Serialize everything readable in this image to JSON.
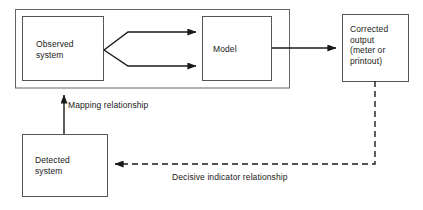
{
  "diagram": {
    "stroke_color": "#1a1a1a",
    "background_color": "#ffffff",
    "nodes": [
      {
        "id": "outer-container",
        "label": "",
        "shape": "rectangle",
        "style": "solid"
      },
      {
        "id": "observed-system",
        "label": "Observed\nsystem",
        "shape": "rectangle",
        "style": "solid"
      },
      {
        "id": "model",
        "label": "Model",
        "shape": "rectangle",
        "style": "solid"
      },
      {
        "id": "corrected-output",
        "label": "Corrected\noutput\n(meter or\nprintout)",
        "shape": "rectangle",
        "style": "solid"
      },
      {
        "id": "detected-system",
        "label": "Detected\nsystem",
        "shape": "rectangle",
        "style": "solid"
      }
    ],
    "edges": [
      {
        "id": "observed-to-model-upper",
        "from": "observed-system",
        "to": "model",
        "style": "solid",
        "arrow": "end",
        "label": ""
      },
      {
        "id": "observed-to-model-lower",
        "from": "observed-system",
        "to": "model",
        "style": "solid",
        "arrow": "end",
        "label": ""
      },
      {
        "id": "model-to-corrected-output",
        "from": "model",
        "to": "corrected-output",
        "style": "solid",
        "arrow": "end",
        "label": ""
      },
      {
        "id": "detected-to-observed",
        "from": "detected-system",
        "to": "observed-system",
        "style": "solid",
        "arrow": "end",
        "label": "Mapping relationship"
      },
      {
        "id": "corrected-output-to-detected",
        "from": "corrected-output",
        "to": "detected-system",
        "style": "dashed",
        "arrow": "end",
        "label": "Decisive indicator relationship"
      }
    ],
    "labels": {
      "mapping_relationship": "Mapping relationship",
      "decisive_indicator_relationship": "Decisive indicator relationship"
    }
  }
}
